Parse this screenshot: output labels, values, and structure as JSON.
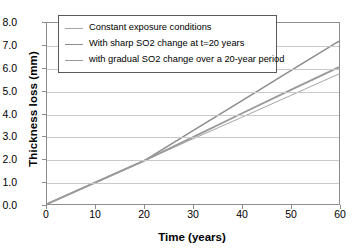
{
  "chart_data": {
    "type": "line",
    "title": "",
    "xlabel": "Time (years)",
    "ylabel": "Thickness loss (mm)",
    "xlim": [
      0,
      60
    ],
    "ylim": [
      0,
      8
    ],
    "xticks": [
      "0",
      "10",
      "20",
      "30",
      "40",
      "50",
      "60"
    ],
    "yticks": [
      "0.0",
      "1.0",
      "2.0",
      "3.0",
      "4.0",
      "5.0",
      "6.0",
      "7.0",
      "8.0"
    ],
    "grid": "horizontal",
    "legend_position": "upper-left",
    "x": [
      0,
      10,
      20,
      30,
      40,
      50,
      60
    ],
    "series": [
      {
        "name": "Constant exposure conditions",
        "values": [
          0.0,
          0.96,
          1.92,
          2.88,
          3.83,
          4.79,
          5.75
        ],
        "color": "#a6a6a6",
        "width": 1.0
      },
      {
        "name": "With sharp SO2 change at t=20 years",
        "values": [
          0.0,
          0.96,
          1.92,
          3.24,
          4.56,
          5.88,
          7.2
        ],
        "color": "#8c8c8c",
        "width": 1.5
      },
      {
        "name": "with gradual SO2 change over a 20-year period",
        "values": [
          0.0,
          0.96,
          1.92,
          2.96,
          4.0,
          5.03,
          6.05
        ],
        "color": "#9a9a9a",
        "width": 1.9
      }
    ]
  },
  "legend": {
    "items": [
      {
        "label": "Constant exposure conditions"
      },
      {
        "label": "With sharp SO2 change at t=20 years"
      },
      {
        "label": "with gradual SO2 change over a 20-year period"
      }
    ]
  }
}
